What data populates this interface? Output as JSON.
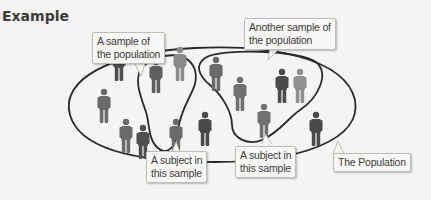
{
  "heading": "Example",
  "callouts": {
    "sample_1": "A sample of\nthe population",
    "sample_2": "Another sample of\nthe population",
    "subject_1": "A subject in\nthis sample",
    "subject_2": "A subject in\nthis sample",
    "population": "The Population"
  },
  "callout_lines": {
    "sample_1": [
      "A sample of",
      "the population"
    ],
    "sample_2": [
      "Another sample of",
      "the population"
    ],
    "subject_1": [
      "A subject in",
      "this sample"
    ],
    "subject_2": [
      "A subject in",
      "this sample"
    ],
    "population": [
      "The Population"
    ]
  },
  "colors": {
    "background": "#f4f4f2",
    "outline": "#2a2a2a",
    "figure_dark": "#4a4a4a",
    "figure_mid": "#6a6a6a",
    "figure_light": "#8a8a8a"
  },
  "figures": [
    {
      "x": 104,
      "y": 95,
      "shade": "mid"
    },
    {
      "x": 119,
      "y": 50,
      "shade": "dark"
    },
    {
      "x": 156,
      "y": 75,
      "shade": "mid"
    },
    {
      "x": 180,
      "y": 55,
      "shade": "light"
    },
    {
      "x": 216,
      "y": 58,
      "shade": "mid"
    },
    {
      "x": 240,
      "y": 85,
      "shade": "mid"
    },
    {
      "x": 282,
      "y": 73,
      "shade": "dark"
    },
    {
      "x": 300,
      "y": 73,
      "shade": "light"
    },
    {
      "x": 125,
      "y": 127,
      "shade": "mid"
    },
    {
      "x": 143,
      "y": 135,
      "shade": "dark"
    },
    {
      "x": 175,
      "y": 120,
      "shade": "mid"
    },
    {
      "x": 205,
      "y": 112,
      "shade": "dark"
    },
    {
      "x": 264,
      "y": 107,
      "shade": "mid"
    },
    {
      "x": 316,
      "y": 113,
      "shade": "dark"
    }
  ]
}
